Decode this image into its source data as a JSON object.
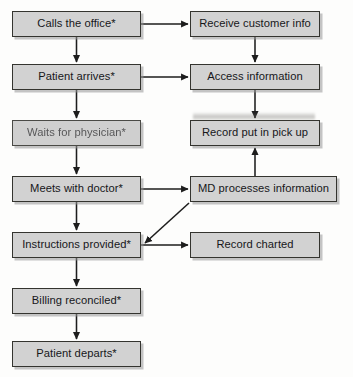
{
  "diagram": {
    "type": "flowchart",
    "orientation": "two-column",
    "colors": {
      "node_fill": "#d2d2d2",
      "node_border": "#34342f",
      "connector": "#1d1d1d",
      "page_background": "#fdfdfc"
    },
    "nodes": [
      {
        "id": "calls_office",
        "label": "Calls the office*",
        "column": "left",
        "x": 12,
        "y": 11,
        "w": 129,
        "h": 26,
        "faded": false
      },
      {
        "id": "receive_info",
        "label": "Receive customer info",
        "column": "right",
        "x": 190,
        "y": 11,
        "w": 130,
        "h": 26,
        "faded": false
      },
      {
        "id": "patient_arrives",
        "label": "Patient arrives*",
        "column": "left",
        "x": 12,
        "y": 64,
        "w": 129,
        "h": 26,
        "faded": false
      },
      {
        "id": "access_info",
        "label": "Access information",
        "column": "right",
        "x": 190,
        "y": 64,
        "w": 130,
        "h": 26,
        "faded": false
      },
      {
        "id": "waits_physician",
        "label": "Waits for physician*",
        "column": "left",
        "x": 12,
        "y": 120,
        "w": 129,
        "h": 26,
        "faded": true
      },
      {
        "id": "record_pickup",
        "label": "Record put in pick up",
        "column": "right",
        "x": 190,
        "y": 120,
        "w": 130,
        "h": 26,
        "faded": false
      },
      {
        "id": "meets_doctor",
        "label": "Meets with doctor*",
        "column": "left",
        "x": 12,
        "y": 176,
        "w": 129,
        "h": 26,
        "faded": false
      },
      {
        "id": "md_processes",
        "label": "MD processes information",
        "column": "right",
        "x": 190,
        "y": 176,
        "w": 147,
        "h": 26,
        "faded": false
      },
      {
        "id": "instructions",
        "label": "Instructions provided*",
        "column": "left",
        "x": 12,
        "y": 232,
        "w": 129,
        "h": 26,
        "faded": false
      },
      {
        "id": "record_charted",
        "label": "Record charted",
        "column": "right",
        "x": 190,
        "y": 232,
        "w": 130,
        "h": 26,
        "faded": false
      },
      {
        "id": "billing",
        "label": "Billing reconciled*",
        "column": "left",
        "x": 12,
        "y": 288,
        "w": 129,
        "h": 26,
        "faded": false
      },
      {
        "id": "patient_departs",
        "label": "Patient departs*",
        "column": "left",
        "x": 12,
        "y": 341,
        "w": 129,
        "h": 26,
        "faded": false
      }
    ],
    "edges": [
      {
        "id": "e1",
        "from": "calls_office",
        "to": "receive_info",
        "kind": "horizontal"
      },
      {
        "id": "e2",
        "from": "calls_office",
        "to": "patient_arrives",
        "kind": "vertical"
      },
      {
        "id": "e3",
        "from": "receive_info",
        "to": "access_info",
        "kind": "vertical"
      },
      {
        "id": "e4",
        "from": "patient_arrives",
        "to": "access_info",
        "kind": "horizontal"
      },
      {
        "id": "e5",
        "from": "patient_arrives",
        "to": "waits_physician",
        "kind": "vertical"
      },
      {
        "id": "e6",
        "from": "access_info",
        "to": "record_pickup",
        "kind": "vertical"
      },
      {
        "id": "e7",
        "from": "waits_physician",
        "to": "meets_doctor",
        "kind": "vertical"
      },
      {
        "id": "e8",
        "from": "meets_doctor",
        "to": "md_processes",
        "kind": "horizontal"
      },
      {
        "id": "e9",
        "from": "md_processes",
        "to": "record_pickup",
        "kind": "vertical-up"
      },
      {
        "id": "e10",
        "from": "meets_doctor",
        "to": "instructions",
        "kind": "vertical"
      },
      {
        "id": "e11",
        "from": "md_processes",
        "to": "instructions",
        "kind": "diagonal"
      },
      {
        "id": "e12",
        "from": "instructions",
        "to": "record_charted",
        "kind": "horizontal"
      },
      {
        "id": "e13",
        "from": "instructions",
        "to": "billing",
        "kind": "vertical"
      },
      {
        "id": "e14",
        "from": "billing",
        "to": "patient_departs",
        "kind": "vertical"
      }
    ]
  }
}
